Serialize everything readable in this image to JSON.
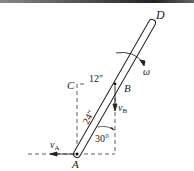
{
  "diagram": {
    "points": {
      "A": "A",
      "B": "B",
      "C": "C",
      "D": "D"
    },
    "dimensions": {
      "CB": "12″",
      "AB": "24″"
    },
    "angle": "30°",
    "angular_velocity": "ω",
    "velocities": {
      "vA": "v",
      "vA_sub": "A",
      "vB": "v",
      "vB_sub": "B"
    },
    "colors": {
      "line": "#222222",
      "background": "#ffffff"
    }
  }
}
